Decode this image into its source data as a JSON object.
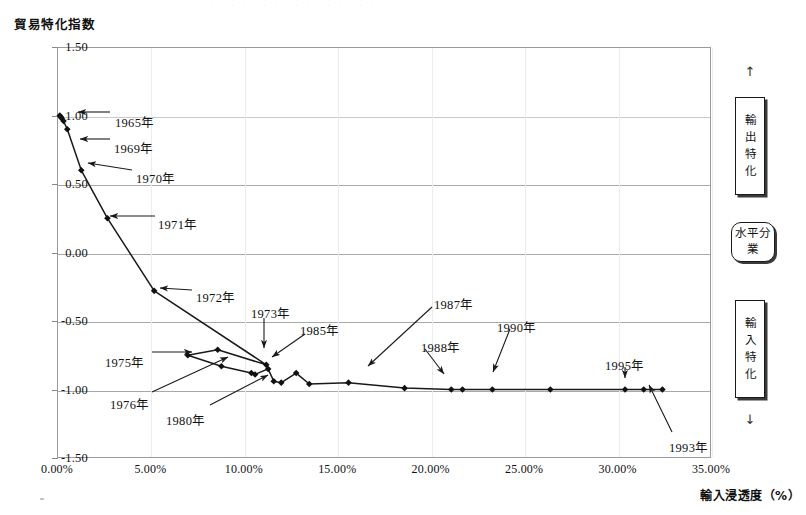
{
  "axis": {
    "y_title": "貿易特化指数",
    "x_title": "輸入浸透度（%）",
    "y_ticks": [
      "1.50",
      "1.00",
      "0.50",
      "0.00",
      "-0.50",
      "-1.00",
      "-1.50"
    ],
    "x_ticks": [
      "0.00%",
      "5.00%",
      "10.00%",
      "15.00%",
      "20.00%",
      "25.00%",
      "30.00%",
      "35.00%"
    ]
  },
  "scan_artifact": "· · · · · · · · · · · · · · · · ·",
  "legend": {
    "top_arrow": "↑",
    "bottom_arrow": "↓",
    "export_box": "輸出特化",
    "horizontal_box_line1": "水平分",
    "horizontal_box_line2": "業",
    "import_box": "輸入特化"
  },
  "annotations": [
    {
      "label": "1965年",
      "x": 115,
      "y": 112
    },
    {
      "label": "1969年",
      "x": 114,
      "y": 138
    },
    {
      "label": "1970年",
      "x": 136,
      "y": 168
    },
    {
      "label": "1971年",
      "x": 158,
      "y": 214
    },
    {
      "label": "1972年",
      "x": 196,
      "y": 287
    },
    {
      "label": "1973年",
      "x": 251,
      "y": 303
    },
    {
      "label": "1975年",
      "x": 105,
      "y": 352
    },
    {
      "label": "1976年",
      "x": 110,
      "y": 394
    },
    {
      "label": "1980年",
      "x": 166,
      "y": 410
    },
    {
      "label": "1985年",
      "x": 300,
      "y": 320
    },
    {
      "label": "1987年",
      "x": 434,
      "y": 294
    },
    {
      "label": "1988年",
      "x": 421,
      "y": 337
    },
    {
      "label": "1990年",
      "x": 497,
      "y": 317
    },
    {
      "label": "1993年",
      "x": 669,
      "y": 437
    },
    {
      "label": "1995年",
      "x": 605,
      "y": 355
    }
  ],
  "chart_data": {
    "type": "line",
    "title": "",
    "xlabel": "輸入浸透度（%）",
    "ylabel": "貿易特化指数",
    "xlim": [
      0,
      35
    ],
    "ylim": [
      -1.5,
      1.5
    ],
    "xunit": "%",
    "grid": true,
    "legend_position": "none",
    "marker": "diamond",
    "series": [
      {
        "name": "貿易特化指数",
        "points": [
          {
            "year": 1965,
            "x": 0.15,
            "y": 1.0
          },
          {
            "year": 1966,
            "x": 0.2,
            "y": 0.99
          },
          {
            "year": 1967,
            "x": 0.25,
            "y": 0.98
          },
          {
            "year": 1968,
            "x": 0.35,
            "y": 0.96
          },
          {
            "year": 1969,
            "x": 0.55,
            "y": 0.9
          },
          {
            "year": 1970,
            "x": 1.3,
            "y": 0.6
          },
          {
            "year": 1971,
            "x": 2.7,
            "y": 0.25
          },
          {
            "year": 1972,
            "x": 5.2,
            "y": -0.28
          },
          {
            "year": 1973,
            "x": 11.2,
            "y": -0.82
          },
          {
            "year": 1974,
            "x": 8.6,
            "y": -0.71
          },
          {
            "year": 1975,
            "x": 7.0,
            "y": -0.75
          },
          {
            "year": 1976,
            "x": 8.8,
            "y": -0.83
          },
          {
            "year": 1977,
            "x": 10.4,
            "y": -0.88
          },
          {
            "year": 1978,
            "x": 10.6,
            "y": -0.89
          },
          {
            "year": 1979,
            "x": 11.3,
            "y": -0.85
          },
          {
            "year": 1980,
            "x": 11.6,
            "y": -0.94
          },
          {
            "year": 1981,
            "x": 12.0,
            "y": -0.95
          },
          {
            "year": 1982,
            "x": 12.8,
            "y": -0.88
          },
          {
            "year": 1983,
            "x": 13.5,
            "y": -0.96
          },
          {
            "year": 1985,
            "x": 15.6,
            "y": -0.95
          },
          {
            "year": 1987,
            "x": 18.6,
            "y": -0.99
          },
          {
            "year": 1988,
            "x": 21.1,
            "y": -1.0
          },
          {
            "year": 1989,
            "x": 21.7,
            "y": -1.0
          },
          {
            "year": 1990,
            "x": 23.3,
            "y": -1.0
          },
          {
            "year": 1991,
            "x": 26.4,
            "y": -1.0
          },
          {
            "year": 1993,
            "x": 32.4,
            "y": -1.0
          },
          {
            "year": 1994,
            "x": 31.4,
            "y": -1.0
          },
          {
            "year": 1995,
            "x": 30.4,
            "y": -1.0
          }
        ]
      }
    ]
  }
}
